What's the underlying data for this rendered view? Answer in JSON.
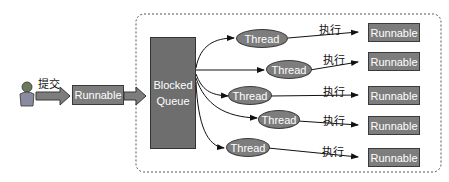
{
  "diagram": {
    "submitter": {
      "icon": "person-icon",
      "action_label": "提交"
    },
    "input_task": {
      "label": "Runnable"
    },
    "queue": {
      "line1": "Blocked",
      "line2": "Queue"
    },
    "threads": [
      {
        "label": "Thread",
        "action_label": "执行",
        "task_label": "Runnable"
      },
      {
        "label": "Thread",
        "action_label": "执行",
        "task_label": "Runnable"
      },
      {
        "label": "Thread",
        "action_label": "执行",
        "task_label": "Runnable"
      },
      {
        "label": "Thread",
        "action_label": "执行",
        "task_label": "Runnable"
      },
      {
        "label": "Thread",
        "action_label": "执行",
        "task_label": "Runnable"
      }
    ],
    "colors": {
      "node_fill": "#7d7d7d",
      "queue_fill": "#6e6e6e",
      "border": "#3a3a3a",
      "text": "#ffffff",
      "dashed_border": "#555555"
    }
  }
}
